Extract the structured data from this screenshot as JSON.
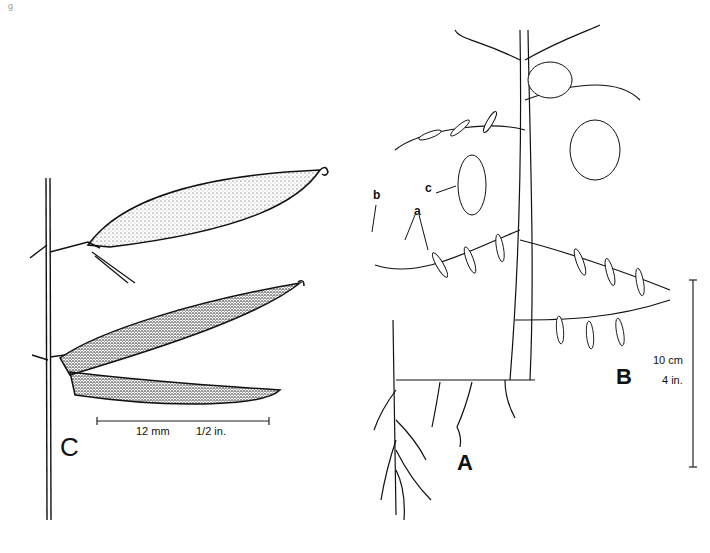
{
  "figure": {
    "panels": [
      {
        "id": "A",
        "label": "A",
        "description": "rooting stem / rhizome"
      },
      {
        "id": "B",
        "label": "B",
        "description": "flowering shoot with pinnate leaves and tendrils"
      },
      {
        "id": "C",
        "label": "C",
        "description": "seed pods"
      }
    ],
    "callouts": {
      "a": "a",
      "b": "b",
      "c": "c"
    },
    "scale_bar_pods": {
      "metric": "12 mm",
      "imperial": "1/2 in."
    },
    "scale_bar_plant": {
      "metric": "10 cm",
      "imperial": "4 in."
    },
    "corner_mark": "g"
  }
}
